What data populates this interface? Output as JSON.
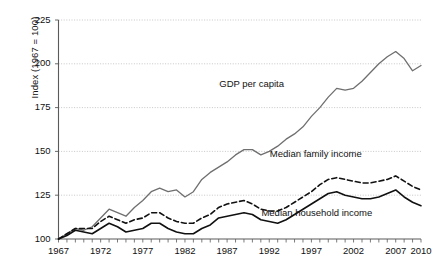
{
  "chart_data": {
    "type": "line",
    "title": "",
    "xlabel": "",
    "ylabel": "Index (1967 = 100)",
    "xlim": [
      1967,
      2010
    ],
    "ylim": [
      100,
      225
    ],
    "yticks": [
      100,
      125,
      150,
      175,
      200,
      225
    ],
    "xticks": [
      1967,
      1972,
      1977,
      1982,
      1987,
      1992,
      1997,
      2002,
      2007,
      2010
    ],
    "xtick_labels": [
      "1967",
      "1972",
      "1977",
      "1982",
      "1987",
      "1992",
      "1997",
      "2002",
      "2007",
      "2010"
    ],
    "ytick_labels": [
      "100",
      "125",
      "150",
      "175",
      "200",
      "225"
    ],
    "grid": "horizontal-dotted",
    "legend": "inline-annotations",
    "minor_xticks_every": 1,
    "x": [
      1967,
      1968,
      1969,
      1970,
      1971,
      1972,
      1973,
      1974,
      1975,
      1976,
      1977,
      1978,
      1979,
      1980,
      1981,
      1982,
      1983,
      1984,
      1985,
      1986,
      1987,
      1988,
      1989,
      1990,
      1991,
      1992,
      1993,
      1994,
      1995,
      1996,
      1997,
      1998,
      1999,
      2000,
      2001,
      2002,
      2003,
      2004,
      2005,
      2006,
      2007,
      2008,
      2009,
      2010
    ],
    "series": [
      {
        "name": "GDP per capita",
        "style": "solid-gray",
        "color": "#6f6f6f",
        "label_x": 1992,
        "label_y": 188,
        "values": [
          100,
          103,
          106,
          105,
          107,
          112,
          117,
          115,
          113,
          118,
          122,
          127,
          129,
          127,
          128,
          124,
          127,
          134,
          138,
          141,
          144,
          148,
          151,
          151,
          148,
          150,
          153,
          157,
          160,
          164,
          170,
          175,
          181,
          186,
          185,
          186,
          190,
          195,
          200,
          204,
          207,
          203,
          196,
          199
        ]
      },
      {
        "name": "Median family income",
        "style": "dashed-black",
        "color": "#111111",
        "label_x": 1998,
        "label_y": 148,
        "values": [
          100,
          103,
          106,
          106,
          106,
          110,
          113,
          111,
          109,
          111,
          112,
          115,
          115,
          112,
          110,
          109,
          109,
          112,
          114,
          118,
          120,
          121,
          122,
          120,
          117,
          116,
          116,
          118,
          121,
          124,
          127,
          131,
          134,
          135,
          134,
          133,
          132,
          132,
          133,
          134,
          136,
          133,
          130,
          128
        ]
      },
      {
        "name": "Median household income",
        "style": "solid-black",
        "color": "#111111",
        "label_x": 1997,
        "label_y": 114,
        "values": [
          100,
          102,
          105,
          104,
          103,
          106,
          109,
          107,
          104,
          105,
          106,
          109,
          109,
          106,
          104,
          103,
          103,
          106,
          108,
          112,
          113,
          114,
          115,
          114,
          111,
          110,
          109,
          111,
          114,
          117,
          120,
          123,
          126,
          127,
          125,
          124,
          123,
          123,
          124,
          126,
          128,
          124,
          121,
          119
        ]
      }
    ],
    "annotations": [
      {
        "text": "GDP per capita"
      },
      {
        "text": "Median family income"
      },
      {
        "text": "Median household income"
      }
    ]
  },
  "axes": {
    "y_title": "Index (1967 = 100)"
  }
}
